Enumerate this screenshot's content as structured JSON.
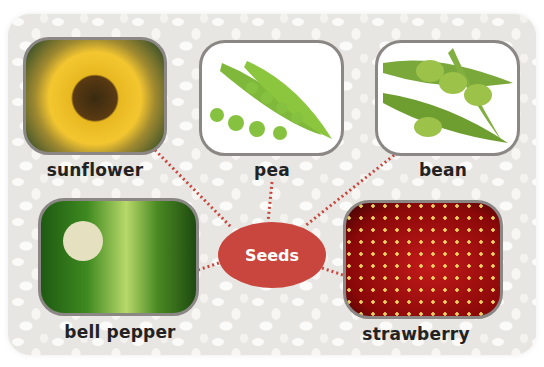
{
  "diagram": {
    "center": {
      "label": "Seeds",
      "color": "#c8463d",
      "text_color": "#ffffff"
    },
    "connector_color": "#c8463d",
    "items": [
      {
        "id": "sunflower",
        "label": "sunflower",
        "image": "sunflower-photo"
      },
      {
        "id": "pea",
        "label": "pea",
        "image": "pea-pod-photo"
      },
      {
        "id": "bean",
        "label": "bean",
        "image": "edamame-bean-photo"
      },
      {
        "id": "bell-pepper",
        "label": "bell pepper",
        "image": "bell-pepper-photo"
      },
      {
        "id": "strawberry",
        "label": "strawberry",
        "image": "strawberry-photo"
      }
    ],
    "background": "white-bean-pebble-texture"
  }
}
